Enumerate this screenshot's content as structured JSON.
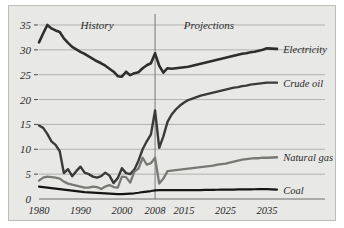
{
  "chart_data": {
    "type": "line",
    "title": "",
    "subtitle": "",
    "xlabel": "",
    "ylabel": "",
    "xlim": [
      1980,
      2035
    ],
    "ylim": [
      0,
      36
    ],
    "grid": true,
    "legend_position": "right-inline",
    "xticks": [
      "1980",
      "1990",
      "2000",
      "2008",
      "2015",
      "2025",
      "2035"
    ],
    "xtick_values": [
      1980,
      1990,
      2000,
      2008,
      2015,
      2025,
      2035
    ],
    "yticks": [
      "0",
      "5",
      "10",
      "15",
      "20",
      "25",
      "30",
      "35"
    ],
    "ytick_values": [
      0,
      5,
      10,
      15,
      20,
      25,
      30,
      35
    ],
    "annotations": [
      {
        "text": "History",
        "x": 1994,
        "y": 34.2
      },
      {
        "text": "Projections",
        "x": 2021,
        "y": 34.2
      }
    ],
    "divider_x": 2008,
    "series": [
      {
        "name": "Electricity",
        "color": "#2e2e2e",
        "width": 2.6,
        "label_x": 2036,
        "label_y": 30.2,
        "x": [
          1980,
          1981,
          1982,
          1983,
          1984,
          1985,
          1986,
          1987,
          1988,
          1989,
          1990,
          1991,
          1992,
          1993,
          1994,
          1995,
          1996,
          1997,
          1998,
          1999,
          2000,
          2001,
          2002,
          2003,
          2004,
          2005,
          2006,
          2007,
          2008,
          2009,
          2010,
          2011,
          2012,
          2013,
          2014,
          2015,
          2016,
          2017,
          2018,
          2019,
          2020,
          2021,
          2022,
          2023,
          2024,
          2025,
          2026,
          2027,
          2028,
          2029,
          2030,
          2031,
          2032,
          2033,
          2034,
          2035
        ],
        "y": [
          31.5,
          33.3,
          35.0,
          34.3,
          33.9,
          33.6,
          32.3,
          31.4,
          30.6,
          30.1,
          29.6,
          29.2,
          28.7,
          28.2,
          27.7,
          27.3,
          26.8,
          26.2,
          25.6,
          24.7,
          24.6,
          25.6,
          24.9,
          25.3,
          25.5,
          26.3,
          26.9,
          27.3,
          29.3,
          26.8,
          25.4,
          26.3,
          26.2,
          26.3,
          26.4,
          26.5,
          26.6,
          26.8,
          27.0,
          27.2,
          27.4,
          27.6,
          27.8,
          28.0,
          28.2,
          28.4,
          28.6,
          28.8,
          29.0,
          29.2,
          29.3,
          29.5,
          29.6,
          29.8,
          30.0,
          30.3
        ]
      },
      {
        "name": "Crude oil",
        "color": "#3a3a3a",
        "width": 2.4,
        "label_x": 2036,
        "label_y": 23.4,
        "x": [
          1980,
          1981,
          1982,
          1983,
          1984,
          1985,
          1986,
          1987,
          1988,
          1989,
          1990,
          1991,
          1992,
          1993,
          1994,
          1995,
          1996,
          1997,
          1998,
          1999,
          2000,
          2001,
          2002,
          2003,
          2004,
          2005,
          2006,
          2007,
          2008,
          2009,
          2010,
          2011,
          2012,
          2013,
          2014,
          2015,
          2016,
          2017,
          2018,
          2019,
          2020,
          2021,
          2022,
          2023,
          2024,
          2025,
          2026,
          2027,
          2028,
          2029,
          2030,
          2031,
          2032,
          2033,
          2034,
          2035
        ],
        "y": [
          14.8,
          14.3,
          13.1,
          11.6,
          10.9,
          9.6,
          5.2,
          6.0,
          4.6,
          5.6,
          6.5,
          5.3,
          5.0,
          4.5,
          4.3,
          4.6,
          5.3,
          4.7,
          3.2,
          4.2,
          6.2,
          5.2,
          5.0,
          5.9,
          7.7,
          10.0,
          11.6,
          13.0,
          17.8,
          10.3,
          12.6,
          15.5,
          17.0,
          18.0,
          18.8,
          19.4,
          19.9,
          20.2,
          20.5,
          20.8,
          21.0,
          21.2,
          21.4,
          21.6,
          21.8,
          22.0,
          22.2,
          22.4,
          22.5,
          22.7,
          22.8,
          23.0,
          23.1,
          23.2,
          23.3,
          23.4
        ]
      },
      {
        "name": "Natural gas",
        "color": "#787874",
        "width": 2.3,
        "label_x": 2036,
        "label_y": 8.4,
        "x": [
          1980,
          1981,
          1982,
          1983,
          1984,
          1985,
          1986,
          1987,
          1988,
          1989,
          1990,
          1991,
          1992,
          1993,
          1994,
          1995,
          1996,
          1997,
          1998,
          1999,
          2000,
          2001,
          2002,
          2003,
          2004,
          2005,
          2006,
          2007,
          2008,
          2009,
          2010,
          2011,
          2012,
          2013,
          2014,
          2015,
          2016,
          2017,
          2018,
          2019,
          2020,
          2021,
          2022,
          2023,
          2024,
          2025,
          2026,
          2027,
          2028,
          2029,
          2030,
          2031,
          2032,
          2033,
          2034,
          2035
        ],
        "y": [
          3.7,
          4.3,
          4.5,
          4.4,
          4.3,
          4.1,
          3.5,
          3.1,
          2.9,
          2.7,
          2.5,
          2.3,
          2.3,
          2.5,
          2.4,
          2.0,
          2.5,
          2.8,
          2.4,
          2.3,
          4.5,
          4.4,
          3.3,
          5.5,
          6.1,
          8.3,
          6.9,
          7.2,
          8.3,
          3.1,
          4.1,
          5.6,
          5.7,
          5.8,
          5.9,
          6.0,
          6.1,
          6.2,
          6.3,
          6.4,
          6.5,
          6.6,
          6.7,
          6.9,
          7.0,
          7.1,
          7.3,
          7.5,
          7.7,
          7.9,
          8.0,
          8.1,
          8.2,
          8.2,
          8.3,
          8.3
        ]
      },
      {
        "name": "Coal",
        "color": "#151515",
        "width": 2.2,
        "label_x": 2036,
        "label_y": 1.9,
        "x": [
          1980,
          1981,
          1982,
          1983,
          1984,
          1985,
          1986,
          1987,
          1988,
          1989,
          1990,
          1991,
          1992,
          1993,
          1994,
          1995,
          1996,
          1997,
          1998,
          1999,
          2000,
          2001,
          2002,
          2003,
          2004,
          2005,
          2006,
          2007,
          2008,
          2009,
          2010,
          2011,
          2012,
          2013,
          2014,
          2015,
          2016,
          2017,
          2018,
          2019,
          2020,
          2021,
          2022,
          2023,
          2024,
          2025,
          2026,
          2027,
          2028,
          2029,
          2030,
          2031,
          2032,
          2033,
          2034,
          2035
        ],
        "y": [
          2.5,
          2.4,
          2.3,
          2.2,
          2.1,
          2.0,
          1.9,
          1.8,
          1.7,
          1.6,
          1.5,
          1.4,
          1.35,
          1.3,
          1.25,
          1.2,
          1.15,
          1.1,
          1.05,
          1.0,
          1.0,
          1.05,
          1.1,
          1.15,
          1.25,
          1.4,
          1.5,
          1.6,
          1.75,
          1.8,
          1.8,
          1.8,
          1.8,
          1.8,
          1.8,
          1.8,
          1.8,
          1.8,
          1.8,
          1.8,
          1.82,
          1.84,
          1.85,
          1.86,
          1.87,
          1.88,
          1.9,
          1.9,
          1.92,
          1.93,
          1.94,
          1.95,
          1.96,
          1.97,
          1.98,
          2.0
        ]
      }
    ]
  }
}
